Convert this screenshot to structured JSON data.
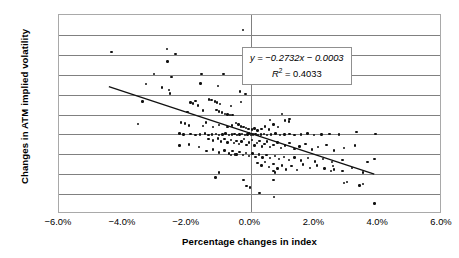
{
  "chart_data": {
    "type": "scatter",
    "title": "",
    "xlabel": "Percentage changes in index",
    "ylabel": "Changes in ATM implied volatility",
    "xlim": [
      -6.0,
      6.0
    ],
    "ylim": [
      -2.0,
      3.0
    ],
    "xticks": [
      "−6.0%",
      "−4.0%",
      "−2.0%",
      "0.0%",
      "2.0%",
      "4.0%",
      "6.0%"
    ],
    "xtick_values": [
      -6.0,
      -4.0,
      -2.0,
      0.0,
      2.0,
      4.0,
      6.0
    ],
    "yticks": [
      "3.0%",
      "2.5%",
      "2.0%",
      "1.5%",
      "1.0%",
      "0.5%",
      "0.0%",
      "−0.5%",
      "−1.0%",
      "−1.5%",
      "−2.0%"
    ],
    "ytick_values": [
      3.0,
      2.5,
      2.0,
      1.5,
      1.0,
      0.5,
      0.0,
      -0.5,
      -1.0,
      -1.5,
      -2.0
    ],
    "grid": true,
    "grid_axis": "y",
    "zero_line_x": 0.0,
    "legend": "none",
    "marker_color": "#111111",
    "gridline_color": "#808080",
    "frame_color": "#a9a9a9",
    "annotation": {
      "equation": "y = −0.2732x − 0.0003",
      "r_squared_label": "R",
      "r_squared_exponent": "2",
      "r_squared_value": "= 0.4033",
      "slope": -0.2732,
      "intercept": -0.0003,
      "r2": 0.4033
    },
    "trendline": {
      "x_start": -4.43,
      "y_start": 1.18,
      "x_end": 3.93,
      "y_end": -1.04
    },
    "points": [
      [
        -4.35,
        2.07
      ],
      [
        -2.62,
        2.15
      ],
      [
        -2.6,
        1.83
      ],
      [
        -2.35,
        2.02
      ],
      [
        -0.23,
        2.63
      ],
      [
        -3.02,
        1.52
      ],
      [
        -2.48,
        1.44
      ],
      [
        -1.53,
        1.52
      ],
      [
        -0.85,
        1.52
      ],
      [
        1.47,
        1.47
      ],
      [
        -3.27,
        1.26
      ],
      [
        -2.78,
        1.18
      ],
      [
        -2.55,
        1.12
      ],
      [
        -2.52,
        1.03
      ],
      [
        -1.57,
        1.28
      ],
      [
        -1.02,
        1.21
      ],
      [
        -0.32,
        1.08
      ],
      [
        -0.16,
        1.02
      ],
      [
        -3.38,
        0.83
      ],
      [
        -1.88,
        0.8
      ],
      [
        -1.8,
        0.78
      ],
      [
        -1.72,
        0.84
      ],
      [
        -1.65,
        0.73
      ],
      [
        -1.3,
        0.88
      ],
      [
        -1.22,
        0.86
      ],
      [
        -1.12,
        0.83
      ],
      [
        -1.05,
        0.8
      ],
      [
        -0.95,
        0.77
      ],
      [
        -0.62,
        0.72
      ],
      [
        -0.3,
        0.81
      ],
      [
        -1.97,
        0.57
      ],
      [
        -1.48,
        0.6
      ],
      [
        -1.07,
        0.62
      ],
      [
        -0.98,
        0.58
      ],
      [
        -0.9,
        0.55
      ],
      [
        -0.8,
        0.52
      ],
      [
        -0.72,
        0.5
      ],
      [
        -0.64,
        0.49
      ],
      [
        -0.56,
        0.48
      ],
      [
        0.62,
        0.36
      ],
      [
        0.98,
        0.51
      ],
      [
        1.22,
        0.38
      ],
      [
        -3.52,
        0.26
      ],
      [
        -2.18,
        0.3
      ],
      [
        -2.05,
        0.27
      ],
      [
        -1.92,
        0.22
      ],
      [
        -1.48,
        0.21
      ],
      [
        -1.4,
        0.3
      ],
      [
        -1.18,
        0.18
      ],
      [
        -0.98,
        0.24
      ],
      [
        -0.72,
        0.18
      ],
      [
        -0.58,
        0.22
      ],
      [
        -0.46,
        0.28
      ],
      [
        -0.38,
        0.25
      ],
      [
        -0.3,
        0.2
      ],
      [
        -0.22,
        0.18
      ],
      [
        -0.14,
        0.16
      ],
      [
        -0.06,
        0.14
      ],
      [
        0.04,
        0.12
      ],
      [
        0.12,
        0.15
      ],
      [
        0.22,
        0.1
      ],
      [
        0.34,
        0.14
      ],
      [
        0.46,
        0.2
      ],
      [
        0.58,
        0.12
      ],
      [
        0.72,
        0.25
      ],
      [
        0.86,
        0.18
      ],
      [
        1.08,
        0.35
      ],
      [
        1.2,
        0.32
      ],
      [
        -2.22,
        0.02
      ],
      [
        -2.1,
        0.0
      ],
      [
        -1.88,
        0.01
      ],
      [
        -1.72,
        -0.01
      ],
      [
        -1.58,
        0.0
      ],
      [
        -1.42,
        0.02
      ],
      [
        -1.32,
        -0.02
      ],
      [
        -1.2,
        0.0
      ],
      [
        -1.08,
        0.01
      ],
      [
        -0.98,
        -0.01
      ],
      [
        -0.88,
        0.0
      ],
      [
        -0.78,
        0.02
      ],
      [
        -0.68,
        -0.01
      ],
      [
        -0.58,
        0.0
      ],
      [
        -0.5,
        0.01
      ],
      [
        -0.42,
        -0.02
      ],
      [
        -0.34,
        0.0
      ],
      [
        -0.26,
        0.01
      ],
      [
        -0.18,
        -0.01
      ],
      [
        -0.1,
        0.0
      ],
      [
        -0.04,
        0.02
      ],
      [
        0.02,
        -0.01
      ],
      [
        0.08,
        0.0
      ],
      [
        0.16,
        0.01
      ],
      [
        0.24,
        -0.02
      ],
      [
        0.32,
        0.0
      ],
      [
        0.42,
        0.01
      ],
      [
        0.52,
        -0.01
      ],
      [
        0.64,
        0.0
      ],
      [
        0.78,
        0.02
      ],
      [
        0.92,
        -0.01
      ],
      [
        1.06,
        0.0
      ],
      [
        1.22,
        0.01
      ],
      [
        1.38,
        -0.01
      ],
      [
        1.58,
        0.0
      ],
      [
        1.78,
        0.02
      ],
      [
        1.98,
        -0.01
      ],
      [
        2.22,
        0.0
      ],
      [
        2.48,
        0.01
      ],
      [
        2.78,
        0.0
      ],
      [
        3.32,
        0.06
      ],
      [
        3.92,
        0.01
      ],
      [
        -1.32,
        -0.12
      ],
      [
        -1.18,
        -0.15
      ],
      [
        -1.02,
        -0.1
      ],
      [
        -0.92,
        -0.18
      ],
      [
        -0.82,
        -0.12
      ],
      [
        -0.72,
        -0.2
      ],
      [
        -0.62,
        -0.14
      ],
      [
        -0.52,
        -0.22
      ],
      [
        -0.44,
        -0.16
      ],
      [
        -0.36,
        -0.24
      ],
      [
        -0.28,
        -0.18
      ],
      [
        -0.2,
        -0.12
      ],
      [
        -0.12,
        -0.26
      ],
      [
        -0.04,
        -0.2
      ],
      [
        0.04,
        -0.14
      ],
      [
        0.12,
        -0.28
      ],
      [
        0.2,
        -0.22
      ],
      [
        0.28,
        -0.16
      ],
      [
        0.36,
        -0.3
      ],
      [
        0.44,
        -0.24
      ],
      [
        0.52,
        -0.18
      ],
      [
        0.62,
        -0.32
      ],
      [
        0.72,
        -0.26
      ],
      [
        0.84,
        -0.2
      ],
      [
        0.96,
        -0.34
      ],
      [
        1.08,
        -0.28
      ],
      [
        1.22,
        -0.22
      ],
      [
        1.38,
        -0.36
      ],
      [
        1.54,
        -0.3
      ],
      [
        1.72,
        -0.24
      ],
      [
        1.92,
        -0.38
      ],
      [
        2.12,
        -0.32
      ],
      [
        2.38,
        -0.26
      ],
      [
        2.62,
        -0.4
      ],
      [
        2.92,
        -0.34
      ],
      [
        3.28,
        -0.28
      ],
      [
        -2.22,
        -0.28
      ],
      [
        -1.92,
        -0.25
      ],
      [
        -1.62,
        -0.32
      ],
      [
        -1.38,
        -0.42
      ],
      [
        -1.18,
        -0.38
      ],
      [
        -0.98,
        -0.45
      ],
      [
        -0.82,
        -0.4
      ],
      [
        -0.68,
        -0.48
      ],
      [
        -0.56,
        -0.42
      ],
      [
        -0.44,
        -0.5
      ],
      [
        -0.34,
        -0.44
      ],
      [
        -0.24,
        -0.52
      ],
      [
        -0.14,
        -0.46
      ],
      [
        -0.04,
        -0.54
      ],
      [
        0.06,
        -0.48
      ],
      [
        0.16,
        -0.56
      ],
      [
        0.26,
        -0.5
      ],
      [
        0.38,
        -0.58
      ],
      [
        0.5,
        -0.52
      ],
      [
        0.62,
        -0.6
      ],
      [
        0.76,
        -0.54
      ],
      [
        0.9,
        -0.62
      ],
      [
        1.04,
        -0.56
      ],
      [
        1.2,
        -0.64
      ],
      [
        1.38,
        -0.58
      ],
      [
        1.58,
        -0.66
      ],
      [
        1.8,
        -0.6
      ],
      [
        2.02,
        -0.68
      ],
      [
        2.28,
        -0.62
      ],
      [
        2.56,
        -0.7
      ],
      [
        2.88,
        -0.64
      ],
      [
        -0.62,
        -0.52
      ],
      [
        -0.48,
        -0.5
      ],
      [
        0.22,
        -0.72
      ],
      [
        0.34,
        -0.78
      ],
      [
        0.46,
        -0.7
      ],
      [
        0.58,
        -0.82
      ],
      [
        0.72,
        -0.74
      ],
      [
        0.84,
        -0.86
      ],
      [
        0.72,
        -0.92
      ],
      [
        0.76,
        -0.96
      ],
      [
        0.98,
        -0.78
      ],
      [
        1.12,
        -0.88
      ],
      [
        1.28,
        -0.8
      ],
      [
        1.46,
        -0.9
      ],
      [
        1.64,
        -0.76
      ],
      [
        1.86,
        -0.84
      ],
      [
        2.08,
        -0.78
      ],
      [
        2.32,
        -0.86
      ],
      [
        2.58,
        -0.8
      ],
      [
        2.88,
        -0.92
      ],
      [
        3.18,
        -0.84
      ],
      [
        3.52,
        -0.96
      ],
      [
        -0.98,
        -0.96
      ],
      [
        -1.1,
        -1.08
      ],
      [
        -0.22,
        -1.14
      ],
      [
        0.72,
        -1.15
      ],
      [
        -0.12,
        -1.3
      ],
      [
        -0.02,
        -1.33
      ],
      [
        0.28,
        -1.47
      ],
      [
        2.92,
        -1.22
      ],
      [
        3.02,
        -1.2
      ],
      [
        3.42,
        -1.28
      ],
      [
        3.52,
        -1.24
      ],
      [
        0.74,
        -1.57
      ],
      [
        3.88,
        -1.74
      ],
      [
        3.66,
        -0.7
      ],
      [
        3.88,
        -0.62
      ],
      [
        2.52,
        -0.92
      ],
      [
        2.62,
        -0.88
      ]
    ]
  }
}
